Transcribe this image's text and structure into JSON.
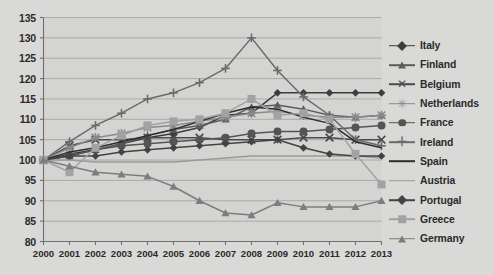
{
  "chart_data": {
    "type": "line",
    "title": "",
    "xlabel": "",
    "ylabel": "",
    "x": [
      2000,
      2001,
      2002,
      2003,
      2004,
      2005,
      2006,
      2007,
      2008,
      2009,
      2010,
      2011,
      2012,
      2013
    ],
    "xtick_labels": [
      "2000",
      "2001",
      "2002",
      "2003",
      "2004",
      "2005",
      "2006",
      "2007",
      "2008",
      "2009",
      "2010",
      "2011",
      "2012",
      "2013"
    ],
    "ytick_labels": [
      "80",
      "85",
      "90",
      "95",
      "100",
      "105",
      "110",
      "115",
      "120",
      "125",
      "130",
      "135"
    ],
    "yticks": [
      80,
      85,
      90,
      95,
      100,
      105,
      110,
      115,
      120,
      125,
      130,
      135
    ],
    "ylim": [
      80,
      135
    ],
    "xlim": [
      2000,
      2013
    ],
    "grid": true,
    "legend_position": "right",
    "series": [
      {
        "name": "Italy",
        "color": "#3d3d3d",
        "marker": "diamond",
        "values": [
          100,
          101.5,
          102.5,
          104,
          105.5,
          106.5,
          108,
          111,
          111.5,
          116.5,
          116.5,
          116.5,
          116.5,
          116.5
        ]
      },
      {
        "name": "Finland",
        "color": "#5c5c5c",
        "marker": "triangle",
        "values": [
          100,
          101,
          102.5,
          104,
          106,
          107.5,
          108.5,
          110,
          113,
          113.5,
          112.5,
          111,
          110.5,
          111
        ]
      },
      {
        "name": "Belgium",
        "color": "#4a4a4a",
        "marker": "x",
        "values": [
          100,
          103.5,
          105,
          105,
          105.5,
          105.5,
          105.5,
          105,
          105,
          105,
          105.5,
          105.5,
          105,
          105
        ]
      },
      {
        "name": "Netherlands",
        "color": "#8a8a8a",
        "marker": "star",
        "values": [
          100,
          103,
          105.5,
          106.5,
          108,
          108.5,
          109.5,
          110.5,
          111.5,
          112,
          111,
          110.5,
          110.5,
          111
        ]
      },
      {
        "name": "France",
        "color": "#545454",
        "marker": "circle",
        "values": [
          100,
          101,
          102.5,
          103.5,
          104,
          104.5,
          105,
          105.5,
          106.5,
          107,
          107,
          107.5,
          108,
          108.5
        ]
      },
      {
        "name": "Ireland",
        "color": "#6b6b6b",
        "marker": "plus",
        "values": [
          100,
          104.5,
          108.5,
          111.5,
          115,
          116.5,
          119,
          122.5,
          130,
          122,
          115.5,
          111,
          105,
          103.5
        ]
      },
      {
        "name": "Spain",
        "color": "#2e2e2e",
        "marker": "none",
        "values": [
          100,
          102,
          103,
          104.5,
          106,
          107.5,
          109.5,
          111.5,
          113,
          112.5,
          110.5,
          109,
          104.5,
          103
        ]
      },
      {
        "name": "Austria",
        "color": "#9a9a9a",
        "marker": "none",
        "values": [
          100,
          100,
          99.5,
          99.5,
          99.5,
          99.5,
          100,
          100.5,
          101,
          101,
          101,
          101,
          101,
          100.5
        ]
      },
      {
        "name": "Portugal",
        "color": "#434343",
        "marker": "diamond",
        "values": [
          100,
          101,
          101,
          102,
          102.5,
          103,
          103.5,
          104,
          104.5,
          105,
          103,
          101.5,
          101,
          101
        ]
      },
      {
        "name": "Greece",
        "color": "#a2a2a2",
        "marker": "square",
        "values": [
          100,
          97,
          103,
          106,
          108.5,
          109.5,
          110,
          111.5,
          115,
          111,
          111.5,
          110,
          101.5,
          94
        ]
      },
      {
        "name": "Germany",
        "color": "#7d7d7d",
        "marker": "triangle",
        "values": [
          100,
          98.5,
          97,
          96.5,
          96,
          93.5,
          90,
          87,
          86.5,
          89.5,
          88.5,
          88.5,
          88.5,
          90
        ]
      }
    ]
  },
  "axes": {
    "background": "#cfcfcd",
    "plot_background": "#d4d4d2",
    "grid_color": "#9f9f9f",
    "axis_color": "#6f6f6f",
    "text_color": "#2b2b2b"
  }
}
